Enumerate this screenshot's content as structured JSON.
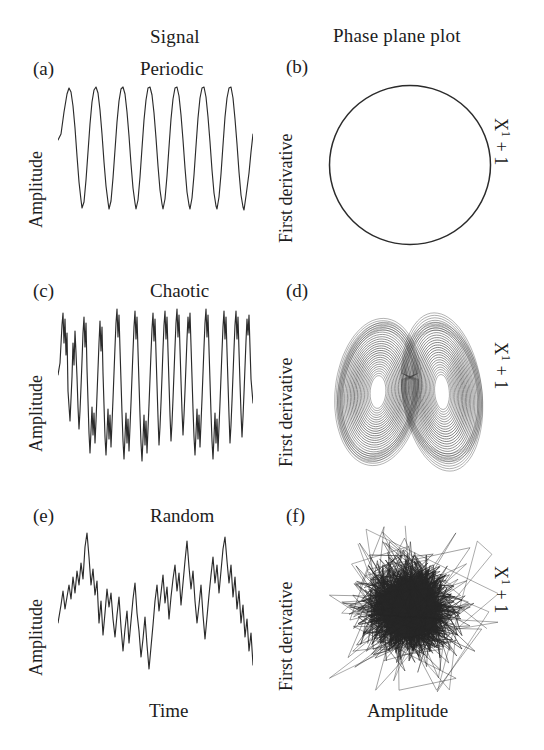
{
  "figure": {
    "columns": {
      "signal": "Signal",
      "phase": "Phase plane plot"
    },
    "axis": {
      "amplitude": "Amplitude",
      "first_derivative": "First derivative",
      "time": "Time",
      "x_next": "X",
      "x_next_sup": "1",
      "x_next_tail": " + 1"
    },
    "panels": [
      {
        "id": "a",
        "letter": "(a)",
        "title": "Periodic",
        "kind": "signal",
        "ylabel": "Amplitude"
      },
      {
        "id": "b",
        "letter": "(b)",
        "title": "",
        "kind": "phase",
        "ylabel": "First derivative",
        "rlabel": "X1 + 1"
      },
      {
        "id": "c",
        "letter": "(c)",
        "title": "Chaotic",
        "kind": "signal",
        "ylabel": "Amplitude"
      },
      {
        "id": "d",
        "letter": "(d)",
        "title": "",
        "kind": "phase",
        "ylabel": "First derivative",
        "rlabel": "X1 + 1"
      },
      {
        "id": "e",
        "letter": "(e)",
        "title": "Random",
        "kind": "signal",
        "ylabel": "Amplitude",
        "xlabel": "Time"
      },
      {
        "id": "f",
        "letter": "(f)",
        "title": "",
        "kind": "phase",
        "ylabel": "First derivative",
        "rlabel": "X1 + 1",
        "xlabel": "Amplitude"
      }
    ]
  },
  "chart_data": [
    {
      "id": "a",
      "type": "line",
      "title": "Periodic",
      "xlabel": "Time",
      "ylabel": "Amplitude",
      "grid": false,
      "legend": "none",
      "description": "Regular sharp-peaked periodic oscillation, about 10 identical cycles",
      "cycles": 10,
      "xlim": [
        0,
        10
      ],
      "ylim": [
        0,
        1
      ],
      "waveform": "periodic-spike",
      "period": 1.0,
      "amplitude": 1.0
    },
    {
      "id": "b",
      "type": "line",
      "title": "Phase plane plot - periodic",
      "xlabel": "Amplitude",
      "ylabel": "First derivative",
      "grid": false,
      "legend": "none",
      "description": "Single closed limit cycle - a near-perfect circle",
      "shape": "circle",
      "center": [
        0,
        0
      ],
      "radius": 1.0,
      "xlim": [
        -1.15,
        1.15
      ],
      "ylim": [
        -1.15,
        1.15
      ]
    },
    {
      "id": "c",
      "type": "line",
      "title": "Chaotic",
      "xlabel": "Time",
      "ylabel": "Amplitude",
      "grid": false,
      "legend": "none",
      "description": "Irregular aperiodic oscillation with varying spike heights and inter-spike spacing",
      "xlim": [
        0,
        10
      ],
      "ylim": [
        0,
        1
      ],
      "waveform": "chaotic"
    },
    {
      "id": "d",
      "type": "line",
      "title": "Phase plane plot - chaotic",
      "xlabel": "Amplitude",
      "ylabel": "First derivative",
      "grid": false,
      "legend": "none",
      "description": "Lorenz-like double-scroll butterfly strange attractor with two spiral lobes",
      "shape": "butterfly-attractor",
      "lobes": 2,
      "xlim": [
        -1.1,
        1.1
      ],
      "ylim": [
        -1.1,
        1.1
      ]
    },
    {
      "id": "e",
      "type": "line",
      "title": "Random",
      "xlabel": "Time",
      "ylabel": "Amplitude",
      "grid": false,
      "legend": "none",
      "description": "Broadband random noise trace with no repeating structure",
      "xlim": [
        0,
        10
      ],
      "ylim": [
        0,
        1
      ],
      "waveform": "random-noise"
    },
    {
      "id": "f",
      "type": "line",
      "title": "Phase plane plot - random",
      "xlabel": "Amplitude",
      "ylabel": "First derivative",
      "grid": false,
      "legend": "none",
      "description": "Dense unstructured scribble filling a blob - no attractor structure",
      "shape": "random-scribble",
      "xlim": [
        -1.1,
        1.1
      ],
      "ylim": [
        -1.1,
        1.1
      ]
    }
  ]
}
